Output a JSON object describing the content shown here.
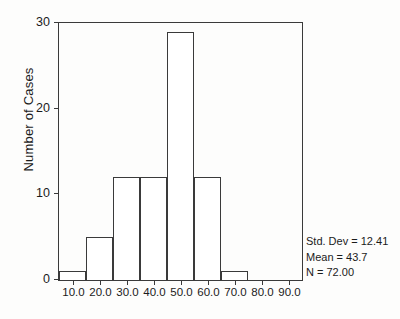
{
  "chart_data": {
    "type": "bar",
    "title": "",
    "subtitle": "",
    "xlabel": "",
    "ylabel": "Number of Cases",
    "categories": [
      "10.0",
      "20.0",
      "30.0",
      "40.0",
      "50.0",
      "60.0",
      "70.0",
      "80.0",
      "90.0"
    ],
    "values": [
      1,
      5,
      12,
      12,
      29,
      12,
      1,
      0,
      0
    ],
    "bin_edges": [
      5,
      15,
      25,
      35,
      45,
      55,
      65,
      75,
      85,
      95
    ],
    "bin_width": 10,
    "xlim": [
      5,
      95
    ],
    "ylim": [
      0,
      30
    ],
    "x_tick_labels": [
      "10.0",
      "20.0",
      "30.0",
      "40.0",
      "50.0",
      "60.0",
      "70.0",
      "80.0",
      "90.0"
    ],
    "y_tick_labels": [
      "0",
      "10",
      "20",
      "30"
    ],
    "y_tick_values": [
      0,
      10,
      20,
      30
    ],
    "grid": false,
    "legend": false,
    "bar_fill": "#ffffff",
    "bar_edge": "#3a3a3a",
    "annotations": [
      "Std. Dev = 12.41",
      "Mean = 43.7",
      "N = 72.00"
    ]
  },
  "axes": {
    "y_title": "Number of Cases",
    "y_ticks": [
      {
        "label": "30",
        "value": 30
      },
      {
        "label": "20",
        "value": 20
      },
      {
        "label": "10",
        "value": 10
      },
      {
        "label": "0",
        "value": 0
      }
    ],
    "x_ticks": [
      {
        "label": "10.0",
        "value": 10
      },
      {
        "label": "20.0",
        "value": 20
      },
      {
        "label": "30.0",
        "value": 30
      },
      {
        "label": "40.0",
        "value": 40
      },
      {
        "label": "50.0",
        "value": 50
      },
      {
        "label": "60.0",
        "value": 60
      },
      {
        "label": "70.0",
        "value": 70
      },
      {
        "label": "80.0",
        "value": 80
      },
      {
        "label": "90.0",
        "value": 90
      }
    ]
  },
  "stats": {
    "std_dev": "Std. Dev = 12.41",
    "mean": "Mean = 43.7",
    "n": "N = 72.00"
  },
  "colors": {
    "axis": "#3a3a3a",
    "text": "#1b1b1b",
    "background": "#fdfdfc"
  }
}
